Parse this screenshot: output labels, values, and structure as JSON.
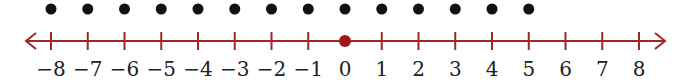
{
  "diagram": {
    "type": "number_line",
    "min": -8,
    "max": 8,
    "tick_labels": [
      "−8",
      "−7",
      "−6",
      "−5",
      "−4",
      "−3",
      "−2",
      "−1",
      "0",
      "1",
      "2",
      "3",
      "4",
      "5",
      "6",
      "7",
      "8"
    ],
    "plotted_dots_above_line": [
      -8,
      -7,
      -6,
      -5,
      -4,
      -3,
      -2,
      -1,
      0,
      1,
      2,
      3,
      4,
      5
    ],
    "highlighted_point": 0,
    "arrows": "both ends",
    "colors": {
      "line": "#a0262a",
      "highlight": "#a0171c",
      "dots": "#111111",
      "labels": "#222222"
    }
  }
}
